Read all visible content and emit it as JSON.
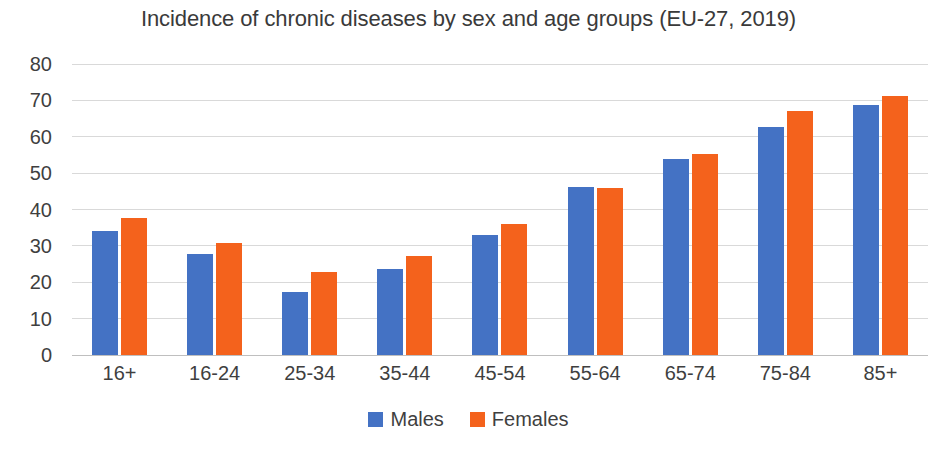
{
  "chart_data": {
    "type": "bar",
    "title": "Incidence of chronic diseases by sex and age groups (EU-27, 2019)",
    "xlabel": "",
    "ylabel": "",
    "ylim": [
      0,
      80
    ],
    "ytick_step": 10,
    "yticks": [
      80,
      70,
      60,
      50,
      40,
      30,
      20,
      10,
      0
    ],
    "grid": true,
    "legend_position": "bottom",
    "categories": [
      "16+",
      "16-24",
      "25-34",
      "35-44",
      "45-54",
      "55-64",
      "65-74",
      "75-84",
      "85+"
    ],
    "series": [
      {
        "name": "Males",
        "color": "#4472C4",
        "values": [
          34.0,
          27.8,
          17.4,
          23.6,
          33.1,
          46.2,
          54.0,
          62.7,
          68.6
        ]
      },
      {
        "name": "Females",
        "color": "#F4621C",
        "values": [
          37.7,
          30.7,
          22.8,
          27.3,
          35.9,
          45.8,
          55.2,
          67.1,
          71.2
        ]
      }
    ]
  },
  "legend": {
    "items": [
      {
        "label": "Males"
      },
      {
        "label": "Females"
      }
    ]
  }
}
